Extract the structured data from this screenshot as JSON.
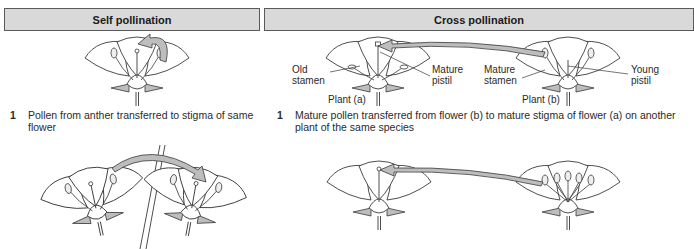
{
  "panels": {
    "self": {
      "header": "Self pollination",
      "steps": [
        {
          "number": "1",
          "text": "Pollen from anther transferred to stigma of same flower"
        }
      ]
    },
    "cross": {
      "header": "Cross pollination",
      "labels": {
        "old_stamen": "Old\nstamen",
        "old_stamen_l1": "Old",
        "old_stamen_l2": "stamen",
        "mature_pistil_l1": "Mature",
        "mature_pistil_l2": "pistil",
        "mature_stamen_l1": "Mature",
        "mature_stamen_l2": "stamen",
        "young_pistil_l1": "Young",
        "young_pistil_l2": "pistil",
        "plant_a": "Plant (a)",
        "plant_b": "Plant (b)"
      },
      "steps": [
        {
          "number": "1",
          "text": "Mature pollen transferred from flower (b) to mature stigma of flower (a) on another plant of the same species"
        }
      ]
    }
  },
  "colors": {
    "header_fill": "#d9d9d9",
    "header_border": "#5a5a5a",
    "arrow_fill": "#bdbdbd",
    "line": "#3a3a3a"
  }
}
